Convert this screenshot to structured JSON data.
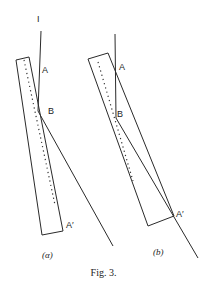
{
  "figure": {
    "caption": "Fig. 3.",
    "panels": [
      {
        "id": "a",
        "label": "(α)",
        "incident_label": "I",
        "points": {
          "A": "A",
          "B": "B",
          "A_prime": "A′"
        }
      },
      {
        "id": "b",
        "label": "(b)",
        "points": {
          "A": "A",
          "B": "B",
          "A_prime": "A′"
        }
      }
    ]
  }
}
